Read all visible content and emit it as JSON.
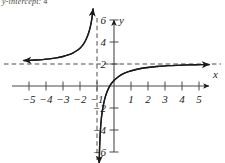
{
  "caption": {
    "text": "y-intercept: 4"
  },
  "chart_data": {
    "type": "line",
    "title": "",
    "subtitle": "",
    "xlabel": "x",
    "ylabel": "y",
    "xlim": [
      -5.6,
      5.9
    ],
    "ylim": [
      -7.2,
      7.4
    ],
    "grid": false,
    "legend": null,
    "x_ticks": [
      -5,
      -4,
      -3,
      -2,
      -1,
      1,
      2,
      3,
      4,
      5
    ],
    "x_tick_labels": [
      "−5",
      "−4",
      "−3",
      "−2",
      "−1",
      "1",
      "2",
      "3",
      "4",
      "5"
    ],
    "y_ticks": [
      6,
      4,
      2,
      -2,
      -4,
      -6
    ],
    "y_tick_labels": [
      "6",
      "4",
      "2",
      "−2",
      "−4",
      "−6"
    ],
    "asymptotes": [
      {
        "name": "horizontal-asymptote",
        "orientation": "horizontal",
        "value": 2,
        "style": "dashed",
        "label": "y = 2"
      },
      {
        "name": "vertical-asymptote",
        "orientation": "vertical",
        "value": -1,
        "style": "dashed",
        "label": "x = -1"
      }
    ],
    "annotations": [],
    "series": [
      {
        "name": "left-branch",
        "style": "solid-curve-with-arrows",
        "arrow_start": "left",
        "arrow_end": "up",
        "points": [
          [
            -5.3,
            2.32
          ],
          [
            -5.0,
            2.33
          ],
          [
            -4.6,
            2.36
          ],
          [
            -4.2,
            2.4
          ],
          [
            -3.8,
            2.46
          ],
          [
            -3.4,
            2.55
          ],
          [
            -3.0,
            2.68
          ],
          [
            -2.7,
            2.82
          ],
          [
            -2.4,
            3.02
          ],
          [
            -2.2,
            3.2
          ],
          [
            -2.0,
            3.44
          ],
          [
            -1.85,
            3.7
          ],
          [
            -1.72,
            4.0
          ],
          [
            -1.6,
            4.38
          ],
          [
            -1.5,
            4.8
          ],
          [
            -1.42,
            5.22
          ],
          [
            -1.35,
            5.7
          ],
          [
            -1.3,
            6.15
          ],
          [
            -1.26,
            6.6
          ],
          [
            -1.23,
            7.0
          ]
        ]
      },
      {
        "name": "right-branch",
        "style": "solid-curve-with-arrows",
        "arrow_start": "down",
        "arrow_end": "right",
        "points": [
          [
            -0.87,
            -7.0
          ],
          [
            -0.86,
            -6.4
          ],
          [
            -0.85,
            -5.7
          ],
          [
            -0.83,
            -5.0
          ],
          [
            -0.81,
            -4.3
          ],
          [
            -0.78,
            -3.6
          ],
          [
            -0.74,
            -2.9
          ],
          [
            -0.69,
            -2.3
          ],
          [
            -0.62,
            -1.7
          ],
          [
            -0.54,
            -1.15
          ],
          [
            -0.44,
            -0.65
          ],
          [
            -0.32,
            -0.22
          ],
          [
            -0.18,
            0.16
          ],
          [
            0.0,
            0.5
          ],
          [
            0.22,
            0.8
          ],
          [
            0.5,
            1.08
          ],
          [
            0.85,
            1.3
          ],
          [
            1.3,
            1.5
          ],
          [
            1.85,
            1.66
          ],
          [
            2.5,
            1.77
          ],
          [
            3.2,
            1.85
          ],
          [
            4.0,
            1.9
          ],
          [
            4.8,
            1.93
          ],
          [
            5.6,
            1.95
          ]
        ]
      }
    ]
  }
}
